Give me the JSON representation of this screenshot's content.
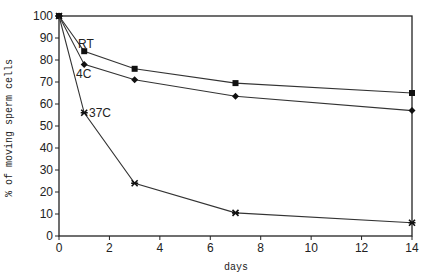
{
  "chart_data": {
    "type": "line",
    "title": "",
    "xlabel": "days",
    "ylabel": "% of moving sperm cells",
    "xlim": [
      0,
      14
    ],
    "ylim": [
      0,
      100
    ],
    "x_ticks": [
      0,
      2,
      4,
      6,
      8,
      10,
      12,
      14
    ],
    "y_ticks": [
      0,
      10,
      20,
      30,
      40,
      50,
      60,
      70,
      80,
      90,
      100
    ],
    "grid": false,
    "legend_position": "inline labels near day 1 points",
    "x": [
      0,
      1,
      3,
      7,
      14
    ],
    "series": [
      {
        "name": "RT",
        "marker": "square",
        "values": [
          100,
          84,
          76,
          69.5,
          65
        ]
      },
      {
        "name": "4C",
        "marker": "diamond",
        "values": [
          100,
          78,
          71,
          63.5,
          57
        ]
      },
      {
        "name": "37C",
        "marker": "star",
        "values": [
          100,
          56,
          24,
          10.5,
          6
        ]
      }
    ]
  },
  "labels": {
    "xlabel": "days",
    "ylabel": "% of moving sperm cells",
    "rt": "RT",
    "c4": "4C",
    "c37": "37C"
  }
}
